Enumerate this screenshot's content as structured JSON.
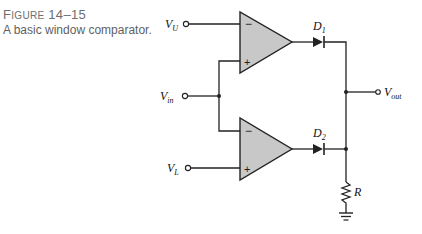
{
  "figure": {
    "number_prefix_cap": "F",
    "number_prefix_rest": "IGURE",
    "number": "14–15",
    "title": "A basic window comparator."
  },
  "diagram": {
    "type": "circuit",
    "colors": {
      "opamp_fill": "#c8c8c8",
      "wire": "#222222"
    },
    "inputs": [
      {
        "id": "VU",
        "label": "V",
        "sub": "U"
      },
      {
        "id": "Vin",
        "label": "V",
        "sub": "in"
      },
      {
        "id": "VL",
        "label": "V",
        "sub": "L"
      }
    ],
    "opamps": [
      {
        "id": "opamp-upper",
        "inverting": "−",
        "noninverting": "+"
      },
      {
        "id": "opamp-lower",
        "inverting": "−",
        "noninverting": "+"
      }
    ],
    "diodes": [
      {
        "id": "D1",
        "label": "D",
        "sub": "1"
      },
      {
        "id": "D2",
        "label": "D",
        "sub": "2"
      }
    ],
    "resistor": {
      "label": "R"
    },
    "output": {
      "label": "V",
      "sub": "out"
    }
  }
}
